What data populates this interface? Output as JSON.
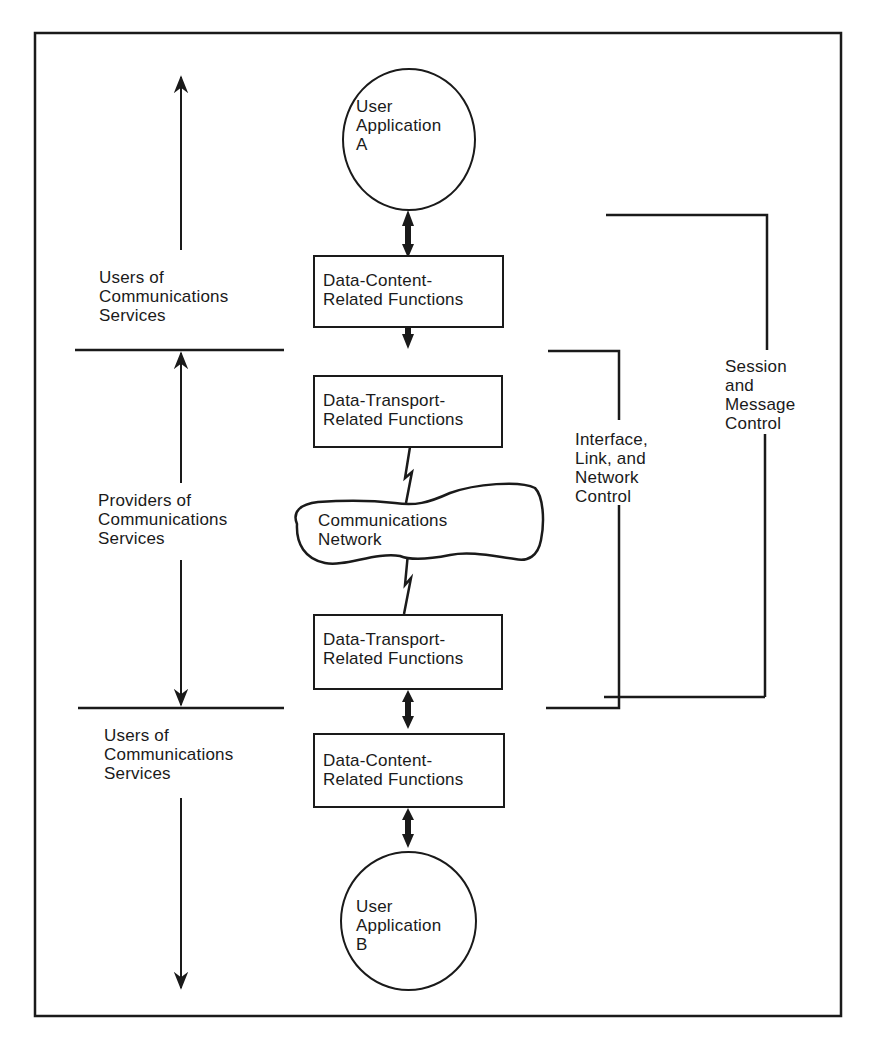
{
  "colors": {
    "ink": "#1a1a1a",
    "background": "#ffffff"
  },
  "nodes": {
    "user_app_a": {
      "label": "User\nApplication\nA"
    },
    "content_top": {
      "label": "Data-Content-\nRelated Functions"
    },
    "transport_top": {
      "label": "Data-Transport-\nRelated Functions"
    },
    "network": {
      "label": "Communications\nNetwork"
    },
    "transport_bottom": {
      "label": "Data-Transport-\nRelated Functions"
    },
    "content_bottom": {
      "label": "Data-Content-\nRelated Functions"
    },
    "user_app_b": {
      "label": "User\nApplication\nB"
    }
  },
  "left_zones": {
    "users_top": "Users of\nCommunications\nServices",
    "providers": "Providers of\nCommunications\nServices",
    "users_bottom": "Users of\nCommunications\nServices"
  },
  "brackets": {
    "interface_link_network": "Interface,\nLink, and\nNetwork\nControl",
    "session_message": "Session\nand\nMessage\nControl"
  },
  "icons": {
    "bidirectional_arrow": "double-headed-arrow",
    "network_link": "lightning-zigzag",
    "span_arrow": "vertical-arrow"
  }
}
